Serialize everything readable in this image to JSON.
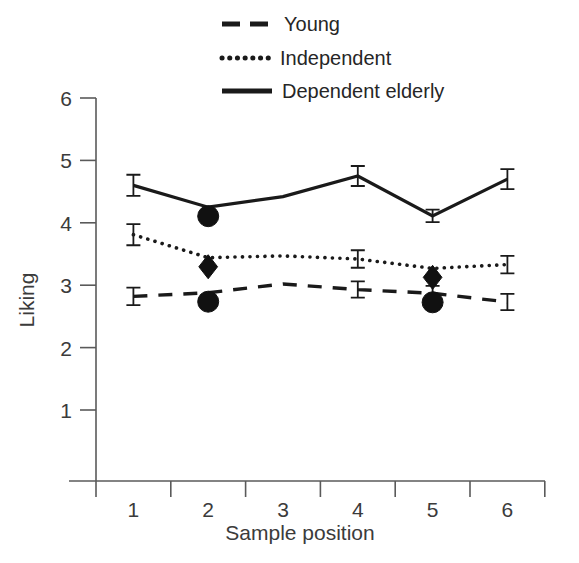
{
  "chart_data": {
    "type": "line",
    "title": "",
    "xlabel": "Sample position",
    "ylabel": "Liking",
    "categories": [
      "1",
      "2",
      "3",
      "4",
      "5",
      "6"
    ],
    "x": [
      1,
      2,
      3,
      4,
      5,
      6
    ],
    "ylim": [
      0,
      6
    ],
    "yticks": [
      1,
      2,
      3,
      4,
      5,
      6
    ],
    "ytick_labels": [
      "1",
      "2",
      "3",
      "4",
      "5",
      "6"
    ],
    "xtick_labels": [
      "1",
      "2",
      "3",
      "4",
      "5",
      "6"
    ],
    "grid": false,
    "legend_position": "top-right",
    "series": [
      {
        "name": "Young",
        "style": "dashed",
        "values": [
          2.82,
          2.88,
          3.02,
          2.93,
          2.87,
          2.73
        ],
        "errors": [
          0.14,
          0.0,
          0.0,
          0.13,
          0.12,
          0.13
        ],
        "markers": [
          null,
          "circle",
          null,
          null,
          "circle",
          null
        ]
      },
      {
        "name": "Independent",
        "style": "dotted",
        "values": [
          3.81,
          3.44,
          3.47,
          3.42,
          3.27,
          3.33
        ],
        "errors": [
          0.17,
          0.0,
          0.0,
          0.14,
          0.0,
          0.14
        ],
        "markers": [
          null,
          "diamond",
          null,
          null,
          "diamond",
          null
        ]
      },
      {
        "name": "Dependent elderly",
        "style": "solid",
        "values": [
          4.6,
          4.25,
          4.42,
          4.75,
          4.11,
          4.7
        ],
        "errors": [
          0.17,
          0.0,
          0.0,
          0.16,
          0.1,
          0.16
        ],
        "markers": [
          null,
          "circle",
          null,
          null,
          null,
          null
        ]
      }
    ]
  },
  "legend": {
    "items": [
      {
        "label": "Young",
        "style": "dashed"
      },
      {
        "label": "Independent",
        "style": "dotted"
      },
      {
        "label": "Dependent elderly",
        "style": "solid"
      }
    ]
  },
  "axes": {
    "y_title": "Liking",
    "x_title": "Sample position"
  }
}
